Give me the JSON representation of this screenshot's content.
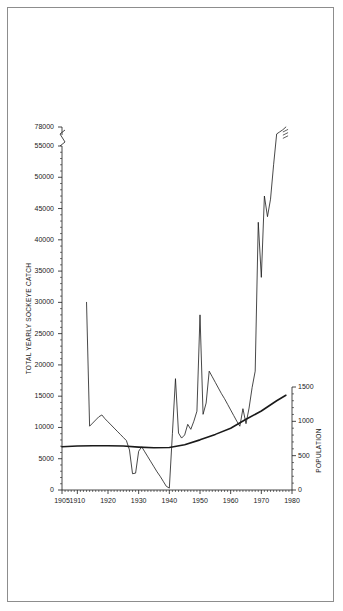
{
  "figure": {
    "border_color": "#8d8d8d",
    "background": "#ffffff",
    "line_color": "#1a1a1a"
  },
  "axes": {
    "left": {
      "label": "TOTAL YEARLY SOCKEYE CATCH",
      "ticks": [
        "0",
        "5000",
        "10000",
        "15000",
        "20000",
        "25000",
        "30000",
        "35000",
        "40000",
        "45000",
        "50000",
        "55000",
        "78000"
      ],
      "break_between": [
        "55000",
        "78000"
      ],
      "minor_tick_interval": 1000
    },
    "right": {
      "label": "POPULATION",
      "ticks": [
        "0",
        "500",
        "1000",
        "1500"
      ],
      "minor_tick_interval": 100
    },
    "bottom": {
      "label": "",
      "ticks": [
        "1905",
        "1910",
        "1920",
        "1930",
        "1940",
        "1950",
        "1960",
        "1970",
        "1980"
      ],
      "minor_tick_interval": 1
    }
  },
  "chart_data": {
    "type": "line",
    "title": "",
    "xlabel": "",
    "ylabel": "TOTAL YEARLY SOCKEYE CATCH",
    "y2label": "POPULATION",
    "xlim": [
      1905,
      1980
    ],
    "ylim": [
      0,
      55000
    ],
    "y2lim": [
      0,
      1500
    ],
    "grid": false,
    "legend": "none",
    "annotations": [
      {
        "text": "axis break on left scale between 55000 and 78000",
        "at_y": 78000
      },
      {
        "text": "series break mark on catch line at final point",
        "at_x": 1978
      }
    ],
    "series": [
      {
        "name": "Total yearly sockeye catch",
        "axis": "left",
        "line_width": 0.8,
        "x": [
          1913,
          1914,
          1915,
          1916,
          1917,
          1918,
          1919,
          1920,
          1921,
          1922,
          1923,
          1924,
          1925,
          1926,
          1927,
          1928,
          1929,
          1930,
          1931,
          1932,
          1933,
          1934,
          1935,
          1936,
          1937,
          1938,
          1939,
          1940,
          1941,
          1942,
          1943,
          1944,
          1945,
          1946,
          1947,
          1948,
          1949,
          1950,
          1951,
          1952,
          1953,
          1954,
          1955,
          1956,
          1957,
          1958,
          1959,
          1960,
          1961,
          1962,
          1963,
          1964,
          1965,
          1966,
          1967,
          1968,
          1969,
          1970,
          1971,
          1972,
          1973,
          1974,
          1975,
          1976,
          1977,
          1978
        ],
        "y": [
          30000,
          10200,
          10700,
          11200,
          11700,
          12000,
          11400,
          10900,
          10400,
          9900,
          9400,
          8900,
          8400,
          7900,
          6400,
          2600,
          2700,
          6200,
          6900,
          6100,
          5300,
          4500,
          3700,
          2900,
          2200,
          1400,
          600,
          300,
          9000,
          17800,
          9100,
          8300,
          8800,
          10500,
          9700,
          11000,
          12600,
          28000,
          12100,
          13900,
          19000,
          18100,
          17200,
          16300,
          15400,
          14600,
          13700,
          12800,
          11900,
          11000,
          10200,
          13000,
          10600,
          13100,
          16400,
          19000,
          42800,
          34000,
          47000,
          43700,
          46500,
          52000,
          58000,
          64000,
          70000,
          78000
        ]
      },
      {
        "name": "Population",
        "axis": "right",
        "line_width": 1.6,
        "x": [
          1905,
          1910,
          1915,
          1920,
          1925,
          1930,
          1935,
          1940,
          1945,
          1950,
          1955,
          1960,
          1965,
          1970,
          1975,
          1978
        ],
        "y": [
          630,
          640,
          645,
          645,
          640,
          625,
          615,
          620,
          660,
          730,
          810,
          900,
          1030,
          1150,
          1300,
          1380
        ]
      }
    ]
  }
}
